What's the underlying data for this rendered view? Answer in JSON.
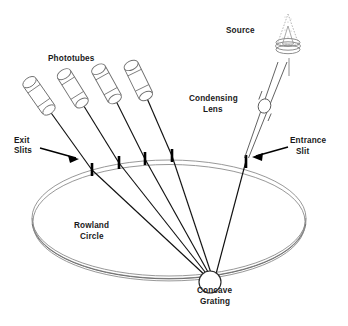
{
  "diagram": {
    "type": "schematic",
    "background_color": "#ffffff",
    "line_color": "#111111",
    "ring_color": "#8c8c8c",
    "label_color": "#1a1a1a",
    "labels": {
      "phototubes": "Phototubes",
      "exit_slits_line1": "Exit",
      "exit_slits_line2": "Slits",
      "rowland_circle_line1": "Rowland",
      "rowland_circle_line2": "Circle",
      "concave_grating_line1": "Concave",
      "concave_grating_line2": "Grating",
      "entrance_slit_line1": "Entrance",
      "entrance_slit_line2": "Slit",
      "condensing_lens_line1": "Condensing",
      "condensing_lens_line2": "Lens",
      "source": "Source"
    },
    "components": {
      "phototube_count": 4,
      "exit_slit_count": 4,
      "entrance_slit_count": 1,
      "grating_count": 1,
      "lens_count": 1,
      "source_count": 1
    },
    "icons": {
      "exit_slits_arrow": "arrow-right-icon",
      "entrance_slit_arrow": "arrow-left-icon",
      "source_flame": "flame-icon",
      "burner": "burner-icon"
    }
  }
}
